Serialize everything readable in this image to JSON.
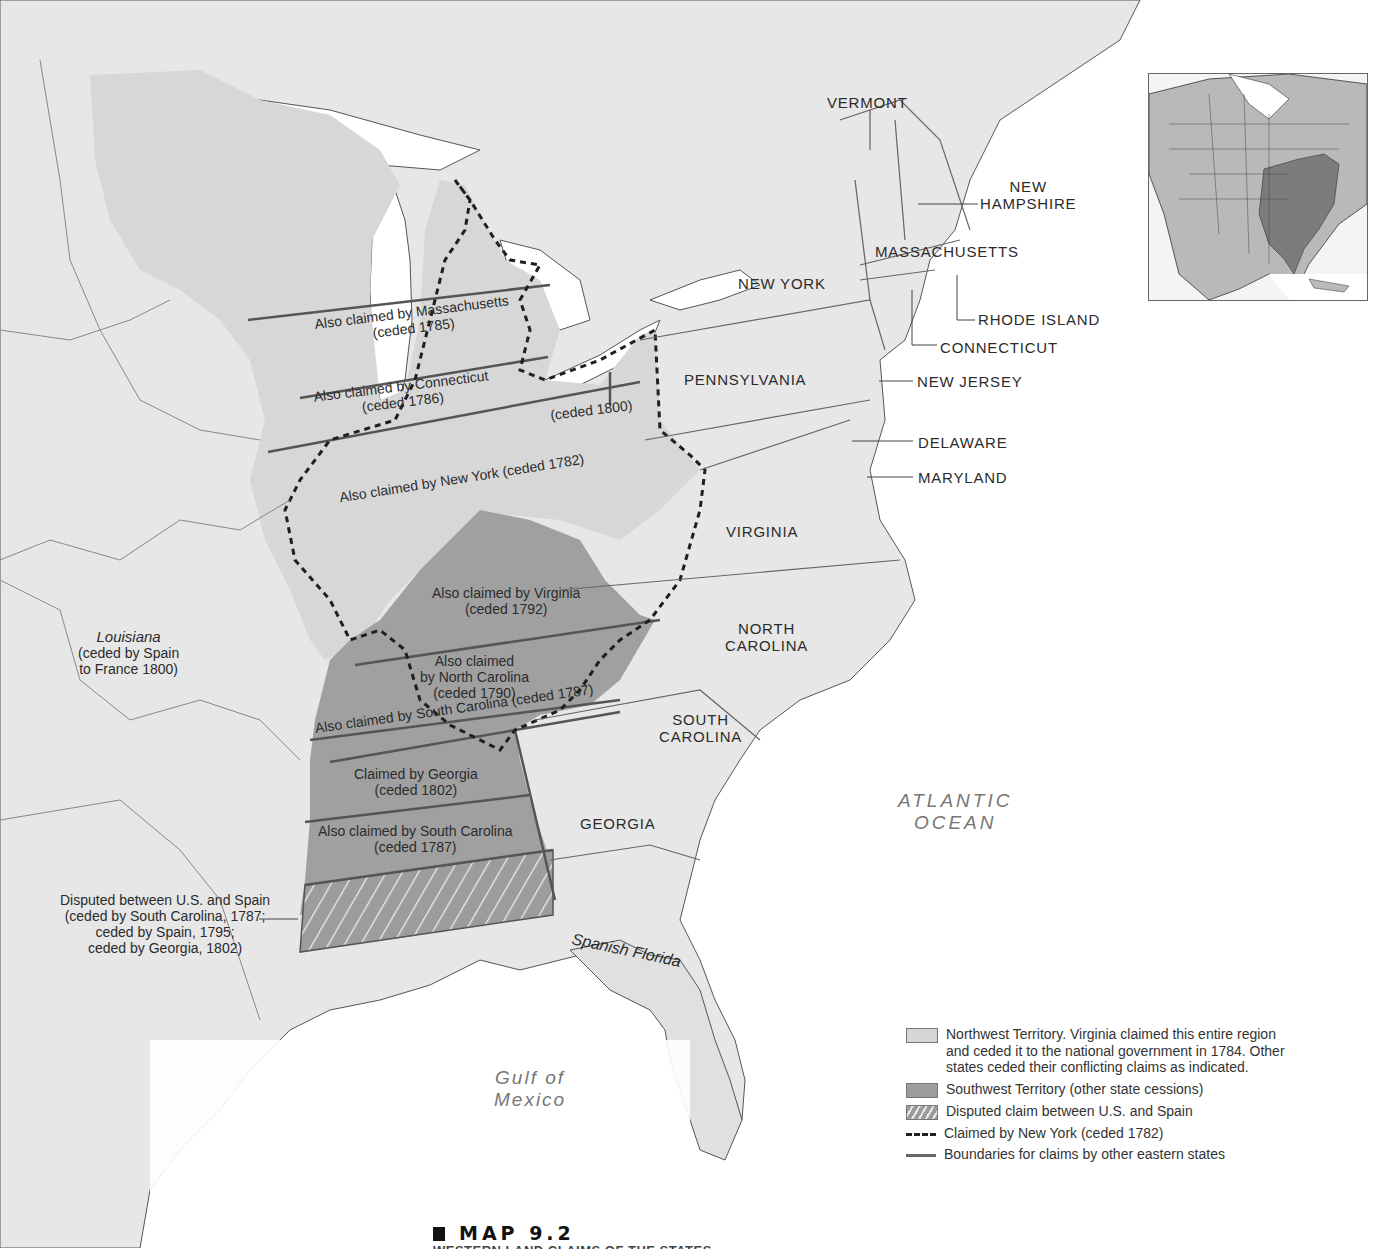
{
  "map": {
    "title": "MAP 9.2",
    "caption_subtitle": "WESTERN LAND CLAIMS OF THE STATES",
    "colors": {
      "ocean": "#ffffff",
      "background_land": "#e6e6e6",
      "northwest_territory": "#d6d6d6",
      "southwest_territory": "#9c9c9c",
      "claim_boundary": "#555555",
      "new_york_dashed": "#1f1f1f"
    },
    "states": [
      {
        "id": "vermont",
        "label": "VERMONT"
      },
      {
        "id": "new-hampshire",
        "label": "NEW\nHAMPSHIRE",
        "line1": "NEW",
        "line2": "HAMPSHIRE"
      },
      {
        "id": "massachusetts",
        "label": "MASSACHUSETTS"
      },
      {
        "id": "new-york",
        "label": "NEW YORK"
      },
      {
        "id": "rhode-island",
        "label": "RHODE ISLAND"
      },
      {
        "id": "connecticut",
        "label": "CONNECTICUT"
      },
      {
        "id": "pennsylvania",
        "label": "PENNSYLVANIA"
      },
      {
        "id": "new-jersey",
        "label": "NEW JERSEY"
      },
      {
        "id": "delaware",
        "label": "DELAWARE"
      },
      {
        "id": "maryland",
        "label": "MARYLAND"
      },
      {
        "id": "virginia",
        "label": "VIRGINIA"
      },
      {
        "id": "north-carolina",
        "label": "NORTH CAROLINA",
        "line1": "NORTH",
        "line2": "CAROLINA"
      },
      {
        "id": "south-carolina",
        "label": "SOUTH CAROLINA",
        "line1": "SOUTH",
        "line2": "CAROLINA"
      },
      {
        "id": "georgia",
        "label": "GEORGIA"
      }
    ],
    "claims": {
      "massachusetts": {
        "line1": "Also claimed by Massachusetts",
        "line2": "(ceded 1785)"
      },
      "connecticut": {
        "line1": "Also claimed by Connecticut",
        "line2": "(ceded 1786)"
      },
      "connecticut_reserve": {
        "line1": "(ceded 1800)"
      },
      "new_york": {
        "line1": "Also claimed by New York (ceded 1782)"
      },
      "virginia": {
        "line1": "Also claimed by Virginia",
        "line2": "(ceded 1792)"
      },
      "north_carolina": {
        "line1": "Also claimed",
        "line2": "by North Carolina",
        "line3": "(ceded 1790)"
      },
      "south_carolina_strip": {
        "line1": "Also claimed by South Carolina (ceded 1787)"
      },
      "georgia": {
        "line1": "Claimed by Georgia",
        "line2": "(ceded 1802)"
      },
      "south_carolina_south": {
        "line1": "Also claimed by South Carolina",
        "line2": "(ceded 1787)"
      },
      "disputed": {
        "line1": "Disputed between U.S. and Spain",
        "line2": "(ceded by South Carolina, 1787;",
        "line3": "ceded by Spain, 1795;",
        "line4": "ceded by Georgia, 1802)"
      }
    },
    "regions": {
      "louisiana": {
        "name": "Louisiana",
        "line2": "(ceded by Spain",
        "line3": "to France 1800)"
      },
      "spanish_florida": {
        "name": "Spanish Florida"
      }
    },
    "water": {
      "atlantic": {
        "line1": "ATLANTIC",
        "line2": "OCEAN"
      },
      "gulf": {
        "line1": "Gulf of",
        "line2": "Mexico"
      }
    },
    "legend": [
      {
        "key": "northwest",
        "icon": "light-gray-swatch",
        "text": "Northwest Territory. Virginia claimed this entire region and ceded it to the national government in 1784. Other states ceded their conflicting claims as indicated."
      },
      {
        "key": "southwest",
        "icon": "dark-gray-swatch",
        "text": "Southwest Territory (other state cessions)"
      },
      {
        "key": "disputed",
        "icon": "hatched-swatch",
        "text": "Disputed claim between U.S. and Spain"
      },
      {
        "key": "new_york",
        "icon": "dashed-line",
        "text": "Claimed by New York (ceded 1782)"
      },
      {
        "key": "boundaries",
        "icon": "solid-line",
        "text": "Boundaries for claims by other eastern states"
      }
    ],
    "inset": {
      "description": "North America locator map with eastern US states highlighted"
    }
  }
}
